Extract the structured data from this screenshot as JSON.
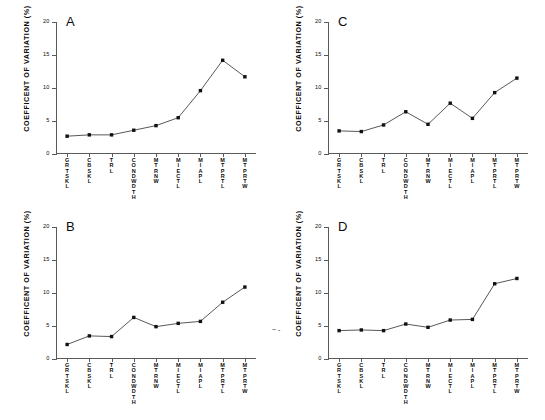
{
  "figure": {
    "background": "#ffffff",
    "ink": "#0d0d0d",
    "axis_color": "#5a5a5a",
    "marker_color": "#111111",
    "line_color": "#3a3a3a",
    "stray_mark": "~ -"
  },
  "axis": {
    "ylabel": "COEFFICENT OF VARIATION (%)",
    "yticks": [
      "0",
      "5",
      "10",
      "15",
      "20"
    ],
    "ytick_values": [
      0,
      5,
      10,
      15,
      20
    ],
    "categories": [
      "GRTSKL",
      "CBSKL",
      "TRL",
      "CONDWDTH",
      "MTRNW",
      "MIECTL",
      "MIAPL",
      "MTPRTL",
      "MTPRTW"
    ]
  },
  "panels": [
    {
      "id": "A",
      "letter": "A",
      "caption": "Merychippus primus, Miocene"
    },
    {
      "id": "B",
      "letter": "B",
      "caption": "Dinohippus leidyanus, Miocene"
    },
    {
      "id": "C",
      "letter": "C",
      "caption": "Equus simplicidens, Pliocene"
    },
    {
      "id": "D",
      "letter": "D",
      "caption": "Equus burchelli, Recent"
    }
  ],
  "chart_data": [
    {
      "type": "line",
      "panel": "A",
      "title": "Merychippus primus, Miocene",
      "xlabel": "",
      "ylabel": "COEFFICENT OF VARIATION (%)",
      "ylim": [
        0,
        20
      ],
      "yticks": [
        0,
        5,
        10,
        15,
        20
      ],
      "grid": false,
      "legend": "none",
      "categories": [
        "GRTSKL",
        "CBSKL",
        "TRL",
        "CONDWDTH",
        "MTRNW",
        "MIECTL",
        "MIAPL",
        "MTPRTL",
        "MTPRTW"
      ],
      "values": [
        2.7,
        2.9,
        2.9,
        3.6,
        4.3,
        5.5,
        9.6,
        14.2,
        11.7
      ]
    },
    {
      "type": "line",
      "panel": "B",
      "title": "Dinohippus leidyanus, Miocene",
      "xlabel": "",
      "ylabel": "COEFFICENT OF VARIATION (%)",
      "ylim": [
        0,
        20
      ],
      "yticks": [
        0,
        5,
        10,
        15,
        20
      ],
      "grid": false,
      "legend": "none",
      "categories": [
        "GRTSKL",
        "CBSKL",
        "TRL",
        "CONDWDTH",
        "MTRNW",
        "MIECTL",
        "MIAPL",
        "MTPRTL",
        "MTPRTW"
      ],
      "values": [
        2.2,
        3.5,
        3.4,
        6.3,
        4.9,
        5.4,
        5.7,
        8.6,
        10.9
      ]
    },
    {
      "type": "line",
      "panel": "C",
      "title": "Equus simplicidens, Pliocene",
      "xlabel": "",
      "ylabel": "COEFFICENT OF VARIATION (%)",
      "ylim": [
        0,
        20
      ],
      "yticks": [
        0,
        5,
        10,
        15,
        20
      ],
      "grid": false,
      "legend": "none",
      "categories": [
        "GRTSKL",
        "CBSKL",
        "TRL",
        "CONDWDTH",
        "MTRNW",
        "MIECTL",
        "MIAPL",
        "MTPRTL",
        "MTPRTW"
      ],
      "values": [
        3.5,
        3.4,
        4.4,
        6.4,
        4.5,
        7.7,
        5.4,
        9.3,
        11.5
      ]
    },
    {
      "type": "line",
      "panel": "D",
      "title": "Equus burchelli, Recent",
      "xlabel": "",
      "ylabel": "COEFFICENT OF VARIATION (%)",
      "ylim": [
        0,
        20
      ],
      "yticks": [
        0,
        5,
        10,
        15,
        20
      ],
      "grid": false,
      "legend": "none",
      "categories": [
        "GRTSKL",
        "CBSKL",
        "TRL",
        "CONDWDTH",
        "MTRNW",
        "MIECTL",
        "MIAPL",
        "MTPRTL",
        "MTPRTW"
      ],
      "values": [
        4.3,
        4.4,
        4.3,
        5.3,
        4.8,
        5.9,
        6.0,
        11.4,
        12.2
      ]
    }
  ]
}
